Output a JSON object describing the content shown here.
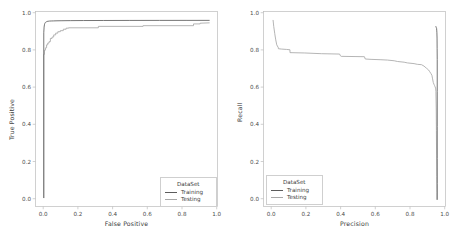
{
  "figure": {
    "background": "#ffffff",
    "panel_count": 2
  },
  "colors": {
    "training": "#5c5c5c",
    "testing": "#a8a8a8",
    "axis": "#b9b9b9",
    "text": "#3d3d3d",
    "legend_border": "#cfcfcf"
  },
  "legend": {
    "title": "DataSet",
    "entries": [
      {
        "label": "Training",
        "color": "#5c5c5c"
      },
      {
        "label": "Testing",
        "color": "#a8a8a8"
      }
    ]
  },
  "chart_data": [
    {
      "type": "line",
      "id": "roc-curve",
      "title": "",
      "xlabel": "False Positive",
      "ylabel": "True Positive",
      "xlim": [
        -0.05,
        1.05
      ],
      "ylim": [
        -0.05,
        1.05
      ],
      "xticks": [
        "0.0",
        "0.2",
        "0.4",
        "0.6",
        "0.8",
        "1.0"
      ],
      "xtick_values": [
        0.0,
        0.2,
        0.4,
        0.6,
        0.8,
        1.0
      ],
      "yticks": [
        "0.0",
        "0.2",
        "0.4",
        "0.6",
        "0.8",
        "1.0"
      ],
      "ytick_values": [
        0.0,
        0.2,
        0.4,
        0.6,
        0.8,
        1.0
      ],
      "grid": false,
      "legend_position": "lower right",
      "series": [
        {
          "name": "Training",
          "color": "#5c5c5c",
          "x": [
            0.0,
            0.0,
            0.002,
            0.004,
            0.006,
            0.009,
            0.012,
            0.016,
            0.02,
            0.026,
            0.034,
            0.045,
            0.06,
            0.08,
            0.11,
            0.16,
            0.24,
            0.36,
            0.52,
            0.7,
            0.86,
            1.0
          ],
          "y": [
            0.0,
            0.93,
            0.962,
            0.975,
            0.982,
            0.987,
            0.99,
            0.992,
            0.994,
            0.995,
            0.996,
            0.9965,
            0.997,
            0.9975,
            0.998,
            0.9985,
            0.999,
            0.9993,
            0.9996,
            0.9998,
            0.9999,
            1.0
          ]
        },
        {
          "name": "Testing",
          "color": "#a8a8a8",
          "x": [
            0.0,
            0.0,
            0.004,
            0.004,
            0.01,
            0.01,
            0.017,
            0.017,
            0.024,
            0.024,
            0.032,
            0.032,
            0.04,
            0.04,
            0.05,
            0.05,
            0.06,
            0.06,
            0.072,
            0.072,
            0.085,
            0.085,
            0.1,
            0.1,
            0.118,
            0.118,
            0.135,
            0.135,
            0.15,
            0.15,
            0.33,
            0.33,
            0.6,
            0.6,
            0.905,
            0.905,
            0.945,
            0.945,
            1.0
          ],
          "y": [
            0.0,
            0.808,
            0.808,
            0.832,
            0.832,
            0.845,
            0.845,
            0.862,
            0.862,
            0.872,
            0.872,
            0.88,
            0.88,
            0.898,
            0.898,
            0.906,
            0.906,
            0.918,
            0.918,
            0.928,
            0.928,
            0.936,
            0.936,
            0.942,
            0.942,
            0.95,
            0.95,
            0.956,
            0.956,
            0.958,
            0.958,
            0.966,
            0.966,
            0.97,
            0.97,
            0.98,
            0.98,
            0.984,
            0.986
          ]
        }
      ]
    },
    {
      "type": "line",
      "id": "precision-recall-curve",
      "title": "",
      "xlabel": "Precision",
      "ylabel": "Recall",
      "xlim": [
        -0.05,
        1.05
      ],
      "ylim": [
        -0.05,
        1.05
      ],
      "xticks": [
        "0.0",
        "0.2",
        "0.4",
        "0.6",
        "0.8",
        "1.0"
      ],
      "xtick_values": [
        0.0,
        0.2,
        0.4,
        0.6,
        0.8,
        1.0
      ],
      "yticks": [
        "0.0",
        "0.2",
        "0.4",
        "0.6",
        "0.8",
        "1.0"
      ],
      "ytick_values": [
        0.0,
        0.2,
        0.4,
        0.6,
        0.8,
        1.0
      ],
      "grid": false,
      "legend_position": "lower left",
      "series": [
        {
          "name": "Training",
          "color": "#5c5c5c",
          "x": [
            0.992,
            0.994,
            0.996,
            0.997,
            0.998,
            0.999,
            0.9995,
            1.0,
            1.0,
            1.0,
            1.0,
            1.0,
            1.0
          ],
          "y": [
            0.965,
            0.96,
            0.955,
            0.945,
            0.93,
            0.9,
            0.84,
            0.78,
            0.6,
            0.4,
            0.22,
            0.08,
            -0.01
          ]
        },
        {
          "name": "Testing",
          "color": "#a8a8a8",
          "x": [
            0.008,
            0.012,
            0.018,
            0.024,
            0.03,
            0.04,
            0.04,
            0.06,
            0.09,
            0.11,
            0.11,
            0.2,
            0.3,
            0.41,
            0.415,
            0.42,
            0.56,
            0.565,
            0.6,
            0.66,
            0.7,
            0.74,
            0.76,
            0.8,
            0.82,
            0.86,
            0.88,
            0.905,
            0.92,
            0.935,
            0.948,
            0.955,
            0.962,
            0.968,
            0.972,
            0.976,
            0.98,
            0.984,
            0.987,
            0.99,
            0.992,
            0.994,
            0.995,
            0.996,
            0.997,
            0.998,
            0.998
          ],
          "y": [
            1.0,
            0.965,
            0.925,
            0.89,
            0.862,
            0.845,
            0.84,
            0.838,
            0.836,
            0.834,
            0.818,
            0.816,
            0.812,
            0.81,
            0.8,
            0.797,
            0.795,
            0.782,
            0.78,
            0.778,
            0.776,
            0.772,
            0.768,
            0.764,
            0.76,
            0.756,
            0.752,
            0.75,
            0.742,
            0.73,
            0.72,
            0.71,
            0.7,
            0.69,
            0.67,
            0.65,
            0.64,
            0.632,
            0.625,
            0.618,
            0.6,
            0.5,
            0.38,
            0.24,
            0.12,
            0.03,
            -0.01
          ]
        }
      ]
    }
  ]
}
